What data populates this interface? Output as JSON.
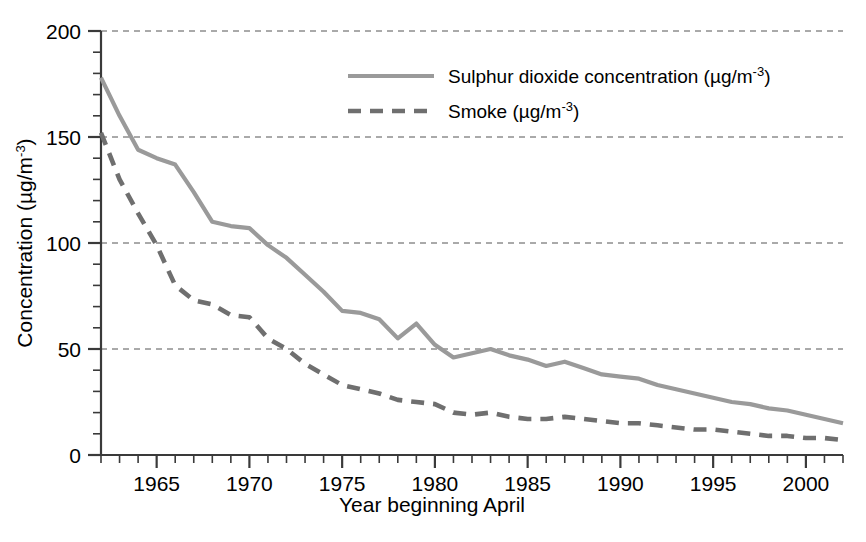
{
  "chart_data": {
    "type": "line",
    "title": "",
    "xlabel": "Year beginning April",
    "ylabel": "Concentration (µg/m",
    "ylabel_sup": "-3",
    "ylabel_tail": ")",
    "xlim": [
      1962,
      2002
    ],
    "ylim": [
      0,
      200
    ],
    "grid": true,
    "grid_axis": "y",
    "legend_position": "top-center",
    "x": [
      1962,
      1963,
      1964,
      1965,
      1966,
      1967,
      1968,
      1969,
      1970,
      1971,
      1972,
      1973,
      1974,
      1975,
      1976,
      1977,
      1978,
      1979,
      1980,
      1981,
      1982,
      1983,
      1984,
      1985,
      1986,
      1987,
      1988,
      1989,
      1990,
      1991,
      1992,
      1993,
      1994,
      1995,
      1996,
      1997,
      1998,
      1999,
      2000,
      2001,
      2002
    ],
    "xticks_major": [
      1965,
      1970,
      1975,
      1980,
      1985,
      1990,
      1995,
      2000
    ],
    "xtick_labels": [
      "1965",
      "1970",
      "1975",
      "1980",
      "1985",
      "1990",
      "1995",
      "2000"
    ],
    "xtick_minor_step": 1,
    "yticks_major": [
      0,
      50,
      100,
      150,
      200
    ],
    "ytick_labels": [
      "0",
      "50",
      "100",
      "150",
      "200"
    ],
    "ytick_minor_step": 10,
    "series": [
      {
        "name": "Sulphur dioxide concentration (µg/m",
        "name_sup": "-3",
        "name_tail": ")",
        "style": "solid",
        "color": "#9a9a9a",
        "values": [
          178,
          160,
          144,
          140,
          137,
          124,
          110,
          108,
          107,
          99,
          93,
          85,
          77,
          68,
          67,
          64,
          55,
          62,
          52,
          46,
          48,
          50,
          47,
          45,
          42,
          44,
          41,
          38,
          37,
          36,
          33,
          31,
          29,
          27,
          25,
          24,
          22,
          21,
          19,
          17,
          15
        ]
      },
      {
        "name": "Smoke (µg/m",
        "name_sup": "-3",
        "name_tail": ")",
        "style": "dashed",
        "color": "#6f6f6f",
        "values": [
          152,
          130,
          114,
          99,
          80,
          73,
          71,
          66,
          65,
          55,
          50,
          43,
          38,
          33,
          31,
          29,
          26,
          25,
          24,
          20,
          19,
          20,
          18,
          17,
          17,
          18,
          17,
          16,
          15,
          15,
          14,
          13,
          12,
          12,
          11,
          10,
          9,
          9,
          8,
          8,
          7
        ]
      }
    ]
  },
  "legend": {
    "items": [
      {
        "label_main": "Sulphur dioxide concentration (µg/m",
        "label_sup": "-3",
        "label_tail": ")",
        "style": "solid"
      },
      {
        "label_main": "Smoke (µg/m",
        "label_sup": "-3",
        "label_tail": ")",
        "style": "dashed"
      }
    ]
  }
}
